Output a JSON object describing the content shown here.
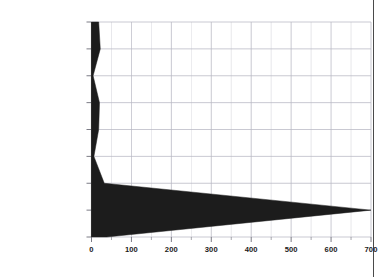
{
  "chart_data": {
    "type": "area",
    "title": "",
    "subtitle": "",
    "xlabel": "",
    "ylabel": "",
    "orientation": "horizontal",
    "grid": true,
    "legend": null,
    "xlim": [
      0,
      700
    ],
    "xticks": [
      0,
      100,
      200,
      300,
      400,
      500,
      600,
      700
    ],
    "xticklabels": [
      "0",
      "100",
      "200",
      "300",
      "400",
      "500",
      "600",
      "700"
    ],
    "minor_tick_step": 50,
    "categories": [
      "Services",
      "Fin, Ins, Real Est.",
      "Retail Trade",
      "Wholesale Trade",
      "Trans., Pub. Util.",
      "Manufacturing",
      "Construction",
      "Mining",
      "Ag. Services"
    ],
    "fill_color": "#1c1c1c",
    "grid_color": "#b9b9c4",
    "axis_color": "#2b2b2b",
    "series": [
      {
        "name": "lower",
        "values": [
          0,
          0,
          0,
          0,
          0,
          0,
          0,
          0,
          0
        ]
      },
      {
        "name": "upper",
        "values": [
          18,
          22,
          4,
          20,
          18,
          6,
          32,
          700,
          38
        ]
      }
    ],
    "band_values": [
      18,
      22,
      4,
      20,
      18,
      6,
      32,
      700,
      38
    ]
  },
  "axis": {
    "tick_labels": [
      "0",
      "100",
      "200",
      "300",
      "400",
      "500",
      "600",
      "700"
    ]
  }
}
